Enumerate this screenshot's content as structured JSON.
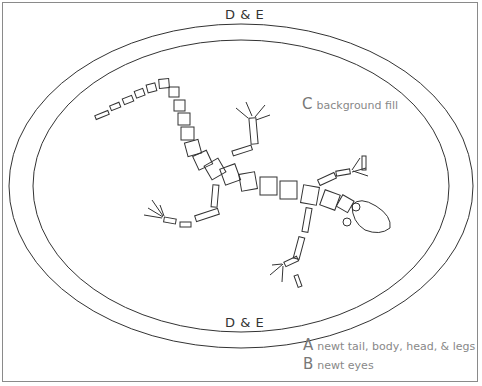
{
  "diagram": {
    "title_top": "D & E",
    "title_bottom": "D & E",
    "labels": {
      "c": {
        "letter": "C",
        "text": "background fill"
      }
    },
    "legend": [
      {
        "letter": "A",
        "text": "newt tail, body, head, & legs"
      },
      {
        "letter": "B",
        "text": "newt eyes"
      }
    ],
    "colors": {
      "stroke": "#333333",
      "frame": "#8a8a8a",
      "label_text": "#888888"
    },
    "shapes": {
      "outer-border": "ellipse",
      "inner-border": "ellipse",
      "newt-segments": "rectangles",
      "newt-head": "blob",
      "newt-eyes": "circles"
    }
  }
}
